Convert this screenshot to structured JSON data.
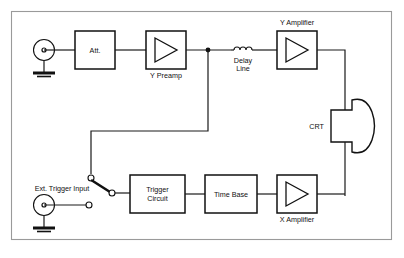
{
  "figure": {
    "kind": "block-diagram",
    "background": "#ffffff",
    "frame_color": "#9a9a9a",
    "line_color": "#111111"
  },
  "blocks": [
    {
      "id": "att",
      "label": "Att.",
      "label_pos": "inside",
      "x": 75,
      "y": 31,
      "w": 40,
      "h": 38
    },
    {
      "id": "ypreamp",
      "label": "Y Preamp",
      "label_pos": "below",
      "x": 146,
      "y": 31,
      "w": 40,
      "h": 38
    },
    {
      "id": "yamp",
      "label": "Y Amplifier",
      "label_pos": "above",
      "x": 277,
      "y": 31,
      "w": 40,
      "h": 38
    },
    {
      "id": "trigger",
      "label": "Trigger\nCircuit",
      "label_pos": "inside",
      "x": 130,
      "y": 175,
      "w": 55,
      "h": 38
    },
    {
      "id": "timebase",
      "label": "Time Base",
      "label_pos": "inside",
      "x": 205,
      "y": 175,
      "w": 52,
      "h": 38
    },
    {
      "id": "xamp",
      "label": "X Amplifier",
      "label_pos": "below",
      "x": 277,
      "y": 175,
      "w": 40,
      "h": 38
    }
  ],
  "labels": {
    "att": "Att.",
    "y_preamp": "Y Preamp",
    "delay_line_1": "Delay",
    "delay_line_2": "Line",
    "y_amplifier": "Y Amplifier",
    "crt": "CRT",
    "ext_trigger_input": "Ext. Trigger Input",
    "trigger_circuit_1": "Trigger",
    "trigger_circuit_2": "Circuit",
    "time_base": "Time Base",
    "x_amplifier": "X Amplifier"
  },
  "components": [
    {
      "id": "y-input-jack",
      "type": "coax-input-jack",
      "x": 44,
      "y": 50
    },
    {
      "id": "y-input-ground",
      "type": "ground-symbol",
      "x": 44,
      "y": 72
    },
    {
      "id": "delay-line-coil",
      "type": "inductor-coil",
      "x": 243,
      "y": 50
    },
    {
      "id": "signal-junction",
      "type": "junction-dot",
      "x": 208,
      "y": 50
    },
    {
      "id": "crt-tube",
      "type": "crt-envelope",
      "x": 345,
      "y": 120
    },
    {
      "id": "ext-trigger-jack",
      "type": "coax-input-jack",
      "x": 44,
      "y": 205
    },
    {
      "id": "ext-trigger-ground",
      "type": "ground-symbol",
      "x": 44,
      "y": 227
    },
    {
      "id": "trigger-source-switch",
      "type": "spdt-switch",
      "x": 100,
      "y": 190
    }
  ],
  "signal_path": [
    "Y input jack",
    "Att.",
    "Y Preamp",
    "Delay Line",
    "Y Amplifier",
    "CRT (vertical plates)",
    "Trigger Circuit",
    "Time Base",
    "X Amplifier",
    "CRT (horizontal plates)"
  ]
}
